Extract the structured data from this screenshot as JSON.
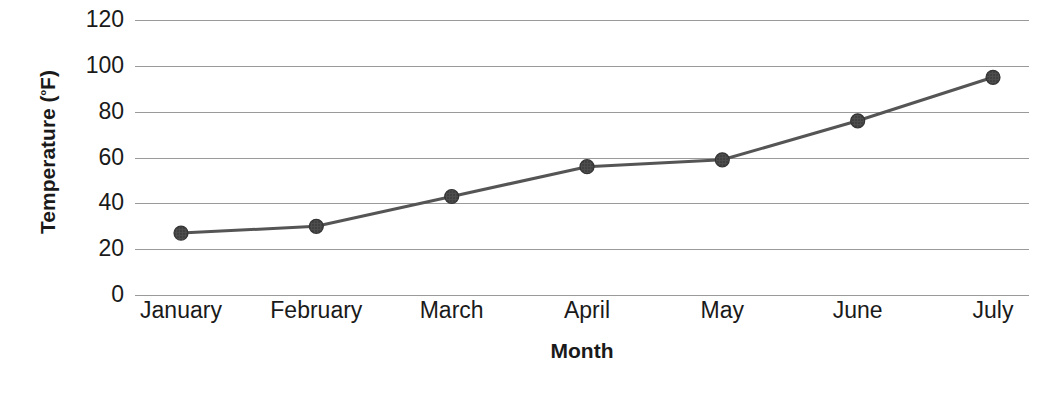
{
  "chart_data": {
    "type": "line",
    "title": "",
    "subtitle": "",
    "xlabel": "Month",
    "ylabel": "Temperature (ºF)",
    "ylabel_text": "Temperature (",
    "ylabel_unit_prefix": "º",
    "ylabel_unit_suffix": "F)",
    "categories": [
      "January",
      "February",
      "March",
      "April",
      "May",
      "June",
      "July"
    ],
    "values": [
      27,
      30,
      43,
      56,
      59,
      76,
      95
    ],
    "series": [
      {
        "name": "Temperature",
        "values": [
          27,
          30,
          43,
          56,
          59,
          76,
          95
        ]
      }
    ],
    "ylim": [
      0,
      120
    ],
    "xlim_categories": 7,
    "y_ticks": [
      0,
      20,
      40,
      60,
      80,
      100,
      120
    ],
    "y_tick_labels": [
      "0",
      "20",
      "40",
      "60",
      "80",
      "100",
      "120"
    ],
    "grid": true,
    "grid_axis": "y",
    "legend": false,
    "legend_position": "none",
    "marker": "circle",
    "marker_size": 14,
    "line_width": 3,
    "colors": {
      "line": "#555555",
      "marker_fill": "#4d4d4d",
      "marker_edge": "#333333",
      "gridline": "#9a9a9a",
      "text": "#1a1a1a",
      "background": "#ffffff"
    }
  }
}
